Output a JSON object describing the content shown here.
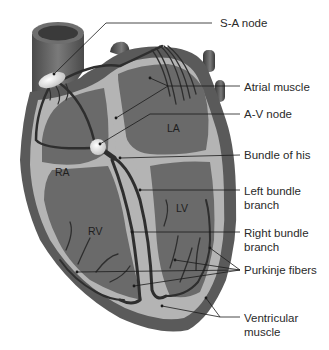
{
  "diagram": {
    "chambers": [
      {
        "id": "ra",
        "label": "RA"
      },
      {
        "id": "la",
        "label": "LA"
      },
      {
        "id": "rv",
        "label": "RV"
      },
      {
        "id": "lv",
        "label": "LV"
      }
    ],
    "callouts": [
      {
        "id": "sa-node",
        "lines": [
          "S-A node"
        ]
      },
      {
        "id": "atrial-muscle",
        "lines": [
          "Atrial muscle"
        ]
      },
      {
        "id": "av-node",
        "lines": [
          "A-V node"
        ]
      },
      {
        "id": "bundle-of-his",
        "lines": [
          "Bundle of his"
        ]
      },
      {
        "id": "left-bundle-branch",
        "lines": [
          "Left bundle",
          "branch"
        ]
      },
      {
        "id": "right-bundle-branch",
        "lines": [
          "Right bundle",
          "branch"
        ]
      },
      {
        "id": "purkinje-fibers",
        "lines": [
          "Purkinje fibers"
        ]
      },
      {
        "id": "ventricular-muscle",
        "lines": [
          "Ventricular",
          "muscle"
        ]
      }
    ],
    "colors": {
      "background": "#ffffff",
      "outer_wall": "#5a5a5a",
      "muscle_light": "#b4b4b4",
      "chamber_dark": "#6a6a6a",
      "conduction_fibers": "#2e2e2e",
      "node_fill": "#e8e8e8",
      "leader_lines": "#1a1a1a",
      "text": "#2a2a2a"
    }
  }
}
